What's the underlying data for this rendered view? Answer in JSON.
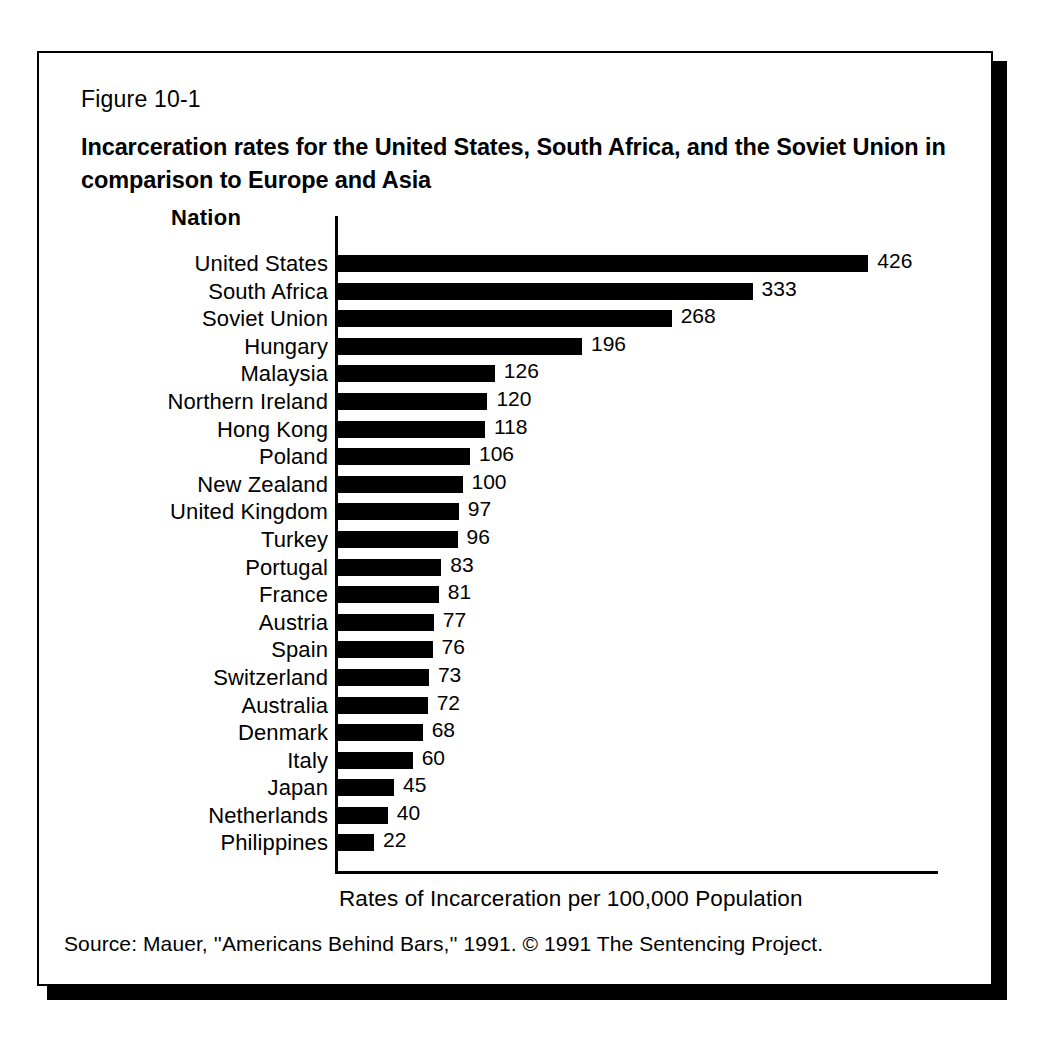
{
  "figure": {
    "number": "Figure 10-1",
    "title": "Incarceration rates for the United States, South Africa, and the Soviet Union in comparison to Europe and Asia",
    "column_header": "Nation",
    "source_note": "Source: Mauer, ''Americans Behind Bars,'' 1991. © 1991 The Sentencing Project."
  },
  "chart_data": {
    "type": "bar",
    "orientation": "horizontal",
    "title": "Incarceration rates for the United States, South Africa, and the Soviet Union in comparison to Europe and Asia",
    "xlabel": "Rates of Incarceration per 100,000 Population",
    "ylabel": "Nation",
    "grid": false,
    "legend": null,
    "xlim": [
      0,
      426
    ],
    "bar_color": "#000000",
    "categories": [
      "United States",
      "South Africa",
      "Soviet Union",
      "Hungary",
      "Malaysia",
      "Northern Ireland",
      "Hong Kong",
      "Poland",
      "New Zealand",
      "United Kingdom",
      "Turkey",
      "Portugal",
      "France",
      "Austria",
      "Spain",
      "Switzerland",
      "Australia",
      "Denmark",
      "Italy",
      "Japan",
      "Netherlands",
      "Philippines"
    ],
    "values": [
      426,
      333,
      268,
      196,
      126,
      120,
      118,
      106,
      100,
      97,
      96,
      83,
      81,
      77,
      76,
      73,
      72,
      68,
      60,
      45,
      40,
      22
    ],
    "value_labels": [
      "426",
      "333",
      "268",
      "196",
      "126",
      "120",
      "118",
      "106",
      "100",
      "97",
      "96",
      "83",
      "81",
      "77",
      "76",
      "73",
      "72",
      "68",
      "60",
      "45",
      "40",
      "22"
    ]
  }
}
